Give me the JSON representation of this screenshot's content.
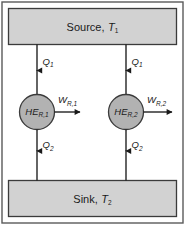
{
  "figure": {
    "border_color": "#5a5a5a",
    "reservoir_fill": "#d2d2d2",
    "engine_fill": "#b2b2b2",
    "stroke_color": "#3b3b3b",
    "text_color": "#1a1a1a"
  },
  "source": {
    "name": "Source",
    "label_main": "Source,",
    "label_symbol": "T",
    "label_subscript": "1"
  },
  "sink": {
    "name": "Sink",
    "label_main": "Sink,",
    "label_symbol": "T",
    "label_subscript": "2"
  },
  "engines": [
    {
      "id": "left",
      "symbol": "HE",
      "subscript": "R,1",
      "heat_in": {
        "symbol": "Q",
        "subscript": "1"
      },
      "heat_out": {
        "symbol": "Q",
        "subscript": "2"
      },
      "work": {
        "symbol": "W",
        "subscript": "R,1"
      }
    },
    {
      "id": "right",
      "symbol": "HE",
      "subscript": "R,2",
      "heat_in": {
        "symbol": "Q",
        "subscript": "1"
      },
      "heat_out": {
        "symbol": "Q",
        "subscript": "2"
      },
      "work": {
        "symbol": "W",
        "subscript": "R,2"
      }
    }
  ]
}
